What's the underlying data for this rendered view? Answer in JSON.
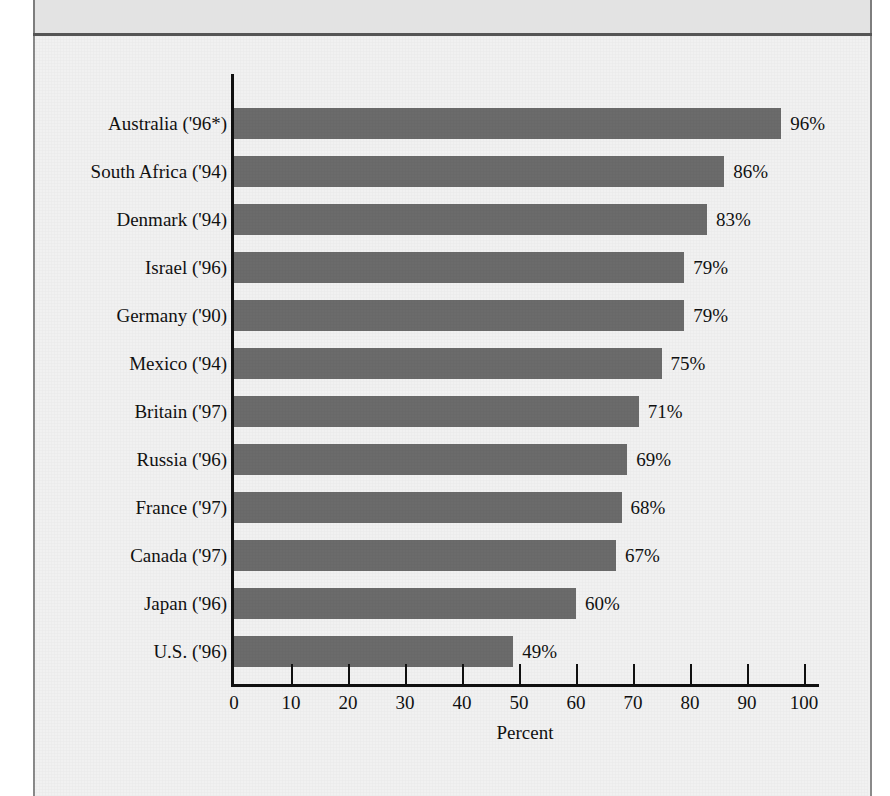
{
  "figure": {
    "background_color": "#f1f1f1",
    "header_band_color": "#e3e3e3",
    "frame_border_color": "#8a8a8a",
    "bar_color": "#6b6b6b",
    "axis_color": "#111111"
  },
  "chart_data": {
    "type": "bar",
    "orientation": "horizontal",
    "title": "",
    "subtitle": "",
    "xlabel": "Percent",
    "ylabel": "",
    "xlim": [
      0,
      100
    ],
    "grid": false,
    "legend": false,
    "footnote_marker": "*",
    "categories": [
      "Australia ('96*)",
      "South Africa ('94)",
      "Denmark ('94)",
      "Israel ('96)",
      "Germany ('90)",
      "Mexico ('94)",
      "Britain ('97)",
      "Russia ('96)",
      "France ('97)",
      "Canada ('97)",
      "Japan ('96)",
      "U.S. ('96)"
    ],
    "values": [
      96,
      86,
      83,
      79,
      79,
      75,
      71,
      69,
      68,
      67,
      60,
      49
    ],
    "value_labels": [
      "96%",
      "86%",
      "83%",
      "79%",
      "79%",
      "75%",
      "71%",
      "69%",
      "68%",
      "67%",
      "60%",
      "49%"
    ],
    "xticks": [
      0,
      10,
      20,
      30,
      40,
      50,
      60,
      70,
      80,
      90,
      100
    ],
    "xtick_labels": [
      "0",
      "10",
      "20",
      "30",
      "40",
      "50",
      "60",
      "70",
      "80",
      "90",
      "100"
    ]
  }
}
